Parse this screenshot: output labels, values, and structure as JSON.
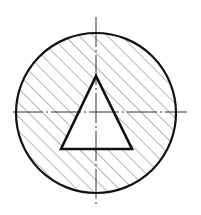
{
  "diagram": {
    "type": "cross-section",
    "colors": {
      "background": "#ffffff",
      "outline": "#111111",
      "hatch": "#7a7a7a",
      "centerline": "#333333"
    },
    "circle": {
      "cx": 96,
      "cy": 113,
      "r": 80
    },
    "triangle": {
      "points": [
        [
          96,
          76
        ],
        [
          61,
          149
        ],
        [
          132,
          149
        ]
      ]
    },
    "centerlines": {
      "vertical": {
        "x": 96,
        "y1": 17,
        "y2": 207
      },
      "horizontal": {
        "y": 112,
        "x1": 13,
        "x2": 187
      }
    },
    "hatch": {
      "angle_deg": 45,
      "spacing": 10
    }
  }
}
